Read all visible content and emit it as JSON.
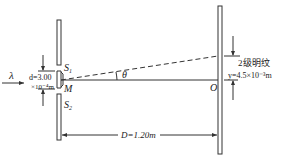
{
  "labels": {
    "wavelength": "λ",
    "slit_spacing_top": "d=3.00",
    "slit_spacing_bottom": "×10⁻⁴m",
    "slit1": "S",
    "slit1_sub": "1",
    "slit2": "S",
    "slit2_sub": "2",
    "midpoint": "M",
    "angle": "θ",
    "origin": "O",
    "fringe": "2级明纹",
    "fringe_position": "y=4.5×10⁻³m",
    "distance": "D=1.20m"
  },
  "values": {
    "d": "3.00×10⁻⁴ m",
    "D": "1.20 m",
    "y": "4.5×10⁻³ m",
    "fringe_order": 2
  }
}
